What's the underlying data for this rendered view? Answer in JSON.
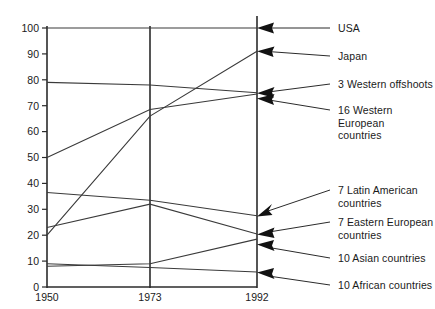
{
  "chart_data": {
    "type": "line",
    "title": "",
    "subtitle": "",
    "xlabel": "",
    "ylabel": "",
    "x": [
      1950,
      1973,
      1992
    ],
    "xtick_labels": [
      "1950",
      "1973",
      "1992"
    ],
    "ytick_labels": [
      "0",
      "10",
      "20",
      "30",
      "40",
      "50",
      "60",
      "70",
      "80",
      "90",
      "100"
    ],
    "yticks": [
      0,
      10,
      20,
      30,
      40,
      50,
      60,
      70,
      80,
      90,
      100
    ],
    "ylim": [
      0,
      100
    ],
    "xlim": [
      1950,
      1992
    ],
    "grid": false,
    "legend_position": "right-labels-with-arrows",
    "series": [
      {
        "name": "USA",
        "values": [
          100,
          100,
          100
        ]
      },
      {
        "name": "Japan",
        "values": [
          20,
          66,
          91
        ]
      },
      {
        "name": "3 Western offshoots",
        "values": [
          79,
          78,
          75
        ]
      },
      {
        "name": "16 Western European countries",
        "values": [
          50,
          68.5,
          74.5
        ]
      },
      {
        "name": "7 Latin American countries",
        "values": [
          36.5,
          33.5,
          27.5
        ]
      },
      {
        "name": "7 Eastern European countries",
        "values": [
          23,
          32,
          20.5
        ]
      },
      {
        "name": "10 Asian countries",
        "values": [
          8,
          9,
          18.5
        ]
      },
      {
        "name": "10 African countries",
        "values": [
          9,
          7.5,
          5.8
        ]
      }
    ],
    "annotations": [
      {
        "text": "USA",
        "value_at_1992": 100
      },
      {
        "text": "Japan",
        "value_at_1992": 91
      },
      {
        "text": "3 Western offshoots",
        "value_at_1992": 75
      },
      {
        "text": "16 Western European\ncountries",
        "value_at_1992": 74.5
      },
      {
        "text": "7 Latin American\ncountries",
        "value_at_1992": 27.5
      },
      {
        "text": "7 Eastern European\ncountries",
        "value_at_1992": 20.5
      },
      {
        "text": "10 Asian countries",
        "value_at_1992": 18.5
      },
      {
        "text": "10 African countries",
        "value_at_1992": 5.8
      }
    ]
  },
  "axes": {
    "y_ticks": [
      {
        "label": "100"
      },
      {
        "label": "90"
      },
      {
        "label": "80"
      },
      {
        "label": "70"
      },
      {
        "label": "60"
      },
      {
        "label": "50"
      },
      {
        "label": "40"
      },
      {
        "label": "30"
      },
      {
        "label": "20"
      },
      {
        "label": "10"
      },
      {
        "label": "0"
      }
    ],
    "x_ticks": [
      {
        "label": "1950"
      },
      {
        "label": "1973"
      },
      {
        "label": "1992"
      }
    ]
  },
  "labels": {
    "usa": "USA",
    "japan": "Japan",
    "western_offshoots": "3 Western offshoots",
    "western_european": "16 Western European\ncountries",
    "latin_american": "7 Latin American\ncountries",
    "eastern_european": "7 Eastern European\ncountries",
    "asian": "10 Asian countries",
    "african": "10 African countries"
  },
  "colors": {
    "line": "#3a3a3a",
    "axis": "#2b2b2b",
    "text": "#1a1a1a",
    "background": "#ffffff"
  }
}
